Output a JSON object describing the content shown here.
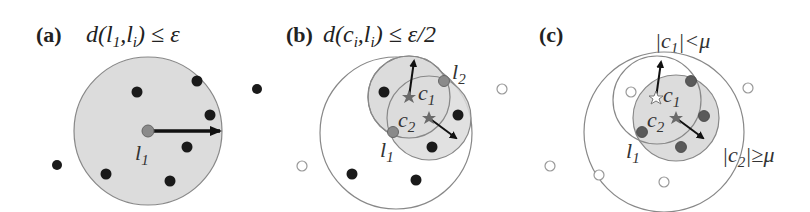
{
  "figure": {
    "panels": [
      {
        "id": "a",
        "label": "(a)",
        "formula": "d(l1,li) ≤ ε",
        "formula_parts": {
          "prefix": "d(l",
          "sub1": "1",
          "mid": ",l",
          "sub2": "i",
          "suffix": ") ≤ ε"
        },
        "point_label": {
          "base": "l",
          "sub": "1"
        }
      },
      {
        "id": "b",
        "label": "(b)",
        "formula": "d(ci,li) ≤ ε/2",
        "formula_parts": {
          "prefix": "d(c",
          "sub1": "i",
          "mid": ",l",
          "sub2": "i",
          "suffix": ") ≤ ε/2"
        },
        "labels": {
          "c1": {
            "base": "c",
            "sub": "1"
          },
          "c2": {
            "base": "c",
            "sub": "2"
          },
          "l1": {
            "base": "l",
            "sub": "1"
          },
          "l2": {
            "base": "l",
            "sub": "2"
          }
        }
      },
      {
        "id": "c",
        "label": "(c)",
        "labels": {
          "c1": {
            "base": "c",
            "sub": "1"
          },
          "c2": {
            "base": "c",
            "sub": "2"
          },
          "l1": {
            "base": "l",
            "sub": "1"
          },
          "c1_cond": {
            "pre": "|c",
            "sub": "1",
            "post": "|<μ"
          },
          "c2_cond": {
            "pre": "|c",
            "sub": "2",
            "post": "|≥μ"
          }
        }
      }
    ],
    "colors": {
      "shaded_fill": "#dcdcdc",
      "circle_stroke": "#808080",
      "dot_dark": "#1a1a1a",
      "dot_gray": "#8a8a8a",
      "star": "#6a6a6a",
      "arrow": "#111111"
    }
  }
}
